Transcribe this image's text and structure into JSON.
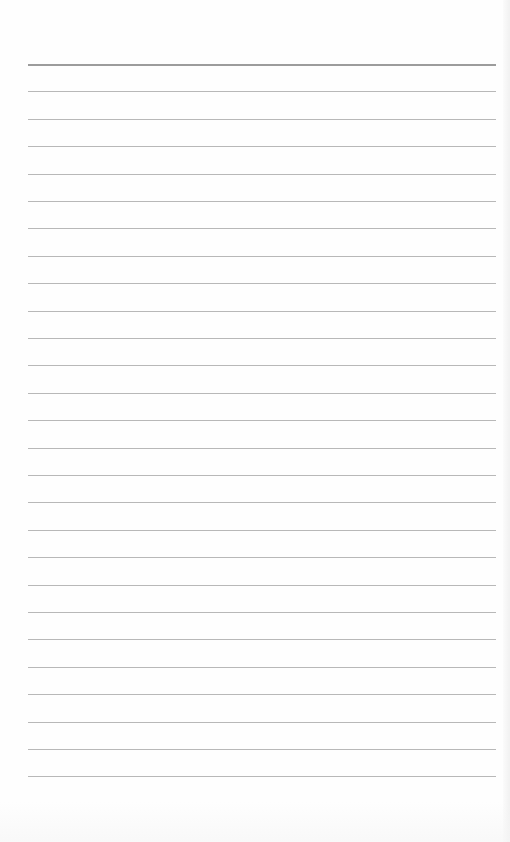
{
  "page": {
    "type": "lined-notebook-page",
    "background_color": "#fefefe",
    "line_color": "#b8b8b8",
    "header_line_color": "#9c9c9c",
    "line_count": 27,
    "first_line_y": 64,
    "line_spacing": 27.4,
    "line_left": 28,
    "line_width": 468,
    "text": ""
  }
}
